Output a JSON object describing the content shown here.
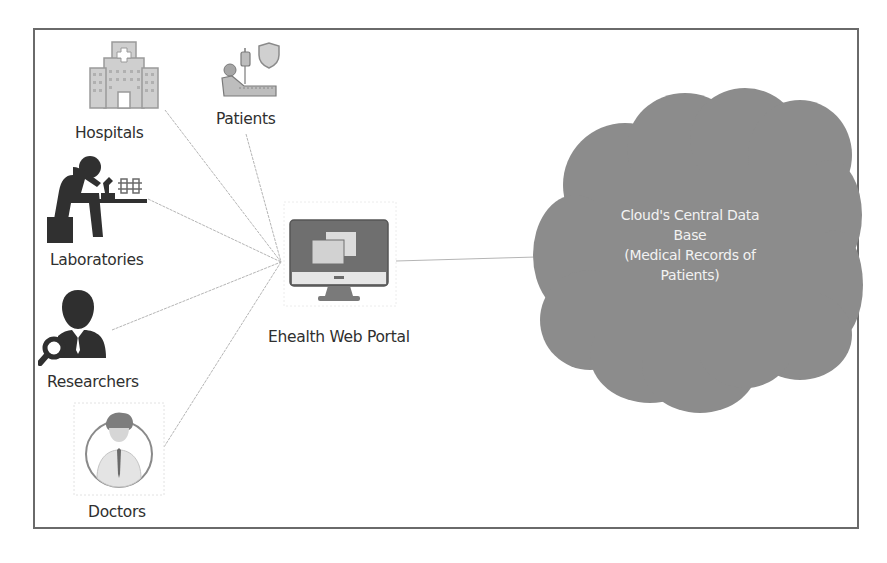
{
  "diagram": {
    "type": "eHealth cloud architecture",
    "hub": {
      "label": "Ehealth Web Portal",
      "icon": "monitor-icon"
    },
    "stakeholders": [
      {
        "id": "hospitals",
        "label": "Hospitals",
        "icon": "hospital-icon"
      },
      {
        "id": "patients",
        "label": "Patients",
        "icon": "patient-bed-icon"
      },
      {
        "id": "laboratories",
        "label": "Laboratories",
        "icon": "lab-scientist-icon"
      },
      {
        "id": "researchers",
        "label": "Researchers",
        "icon": "researcher-icon"
      },
      {
        "id": "doctors",
        "label": "Doctors",
        "icon": "doctor-icon"
      }
    ],
    "cloud": {
      "lines": [
        "Cloud's Central Data",
        "Base",
        "(Medical Records of",
        "Patients)"
      ],
      "fill_color": "#8c8c8c",
      "text_color": "#f2f2f2"
    },
    "edges": [
      {
        "from": "hospitals",
        "to": "hub"
      },
      {
        "from": "patients",
        "to": "hub"
      },
      {
        "from": "laboratories",
        "to": "hub"
      },
      {
        "from": "researchers",
        "to": "hub"
      },
      {
        "from": "doctors",
        "to": "hub"
      },
      {
        "from": "hub",
        "to": "cloud"
      }
    ],
    "colors": {
      "frame": "#6a6a6a",
      "connector": "#b5b5b5",
      "icon_dark": "#3a3a3a",
      "icon_light": "#c8c8c8"
    }
  }
}
